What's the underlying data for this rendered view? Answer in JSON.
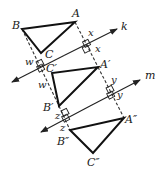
{
  "diagram": {
    "lines": [
      {
        "name": "k",
        "label": "k",
        "from": [
          12,
          82
        ],
        "to": [
          117,
          29
        ]
      },
      {
        "name": "m",
        "label": "m",
        "from": [
          41,
          132
        ],
        "to": [
          140,
          80
        ]
      }
    ],
    "triangles": [
      {
        "name": "ABC",
        "vertices": {
          "A": [
            75,
            22
          ],
          "B": [
            22,
            29
          ],
          "C": [
            41,
            53
          ]
        },
        "labels": {
          "A": "A",
          "B": "B",
          "C": "C"
        }
      },
      {
        "name": "A'B'C'",
        "vertices": {
          "A": [
            98,
            67
          ],
          "B": [
            59,
            106
          ],
          "C": [
            52,
            73
          ]
        },
        "labels": {
          "A": "A′",
          "B": "B′",
          "C": "C′"
        }
      },
      {
        "name": "A''B''C''",
        "vertices": {
          "A": [
            124,
            118
          ],
          "B": [
            70,
            130
          ],
          "C": [
            93,
            153
          ]
        },
        "labels": {
          "A": "A″",
          "B": "B″",
          "C": "C″"
        }
      }
    ],
    "distance_labels": {
      "x1": "x",
      "x2": "x",
      "w1": "w",
      "w2": "w",
      "y1": "y",
      "y2": "y",
      "z1": "z",
      "z2": "z"
    }
  }
}
